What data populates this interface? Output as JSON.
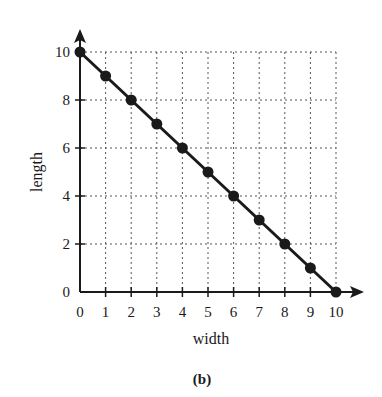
{
  "caption": "(b)",
  "chart_data": {
    "type": "line",
    "title": "",
    "xlabel": "width",
    "ylabel": "length",
    "xlim": [
      0,
      10
    ],
    "ylim": [
      0,
      10
    ],
    "x_ticks": [
      "0",
      "1",
      "2",
      "3",
      "4",
      "5",
      "6",
      "7",
      "8",
      "9",
      "10"
    ],
    "y_ticks": [
      "0",
      "2",
      "4",
      "6",
      "8",
      "10"
    ],
    "grid": true,
    "grid_style": "dotted",
    "markers": true,
    "x": [
      0,
      1,
      2,
      3,
      4,
      5,
      6,
      7,
      8,
      9,
      10
    ],
    "series": [
      {
        "name": "length vs width",
        "values": [
          10,
          9,
          8,
          7,
          6,
          5,
          4,
          3,
          2,
          1,
          0
        ]
      }
    ],
    "colors": {
      "line": "#1a1a1a",
      "grid": "#555555"
    }
  }
}
